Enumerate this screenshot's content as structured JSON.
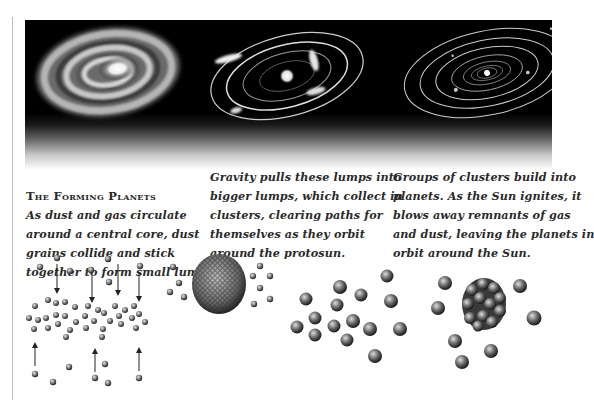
{
  "figure": {
    "panels": [
      {
        "id": "disk",
        "illustration": "spiral-dust-disk"
      },
      {
        "id": "lumps",
        "illustration": "protosun-with-orbiting-clumps"
      },
      {
        "id": "system",
        "illustration": "solar-system-orbits"
      }
    ]
  },
  "captions": [
    {
      "heading": "The Forming Planets",
      "lines": [
        "As dust and gas circulate",
        "around a central core, dust",
        "grains collide and stick",
        "together to form small lumps."
      ]
    },
    {
      "lines": [
        "Gravity pulls these lumps into",
        "bigger lumps, which collect in",
        "clusters, clearing paths for",
        "themselves as they orbit",
        "around the protosun."
      ]
    },
    {
      "lines": [
        "Groups of clusters build into",
        "planets. As the Sun ignites, it",
        "blows away remnants of gas",
        "and dust, leaving the planets in",
        "orbit around the Sun."
      ]
    }
  ],
  "diagrams": [
    {
      "id": "grains-colliding",
      "illustration": "dust-grains-with-arrows"
    },
    {
      "id": "lump-cluster",
      "illustration": "lump-with-scattered-grains"
    },
    {
      "id": "clusters",
      "illustration": "scattered-clusters"
    },
    {
      "id": "planet",
      "illustration": "planet-with-clusters"
    }
  ],
  "colors": {
    "background": "#ffffff",
    "band": "#000000",
    "text": "#2a2a2a",
    "rule": "#bdbdbd"
  }
}
